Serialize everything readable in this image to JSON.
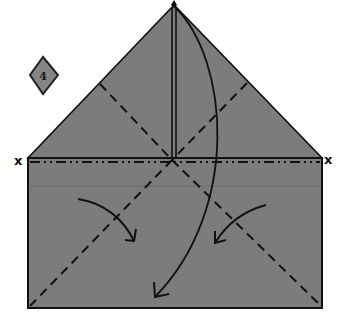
{
  "diagram": {
    "type": "origami-fold-step",
    "step_number": "4",
    "colors": {
      "paper": "#7c7c7c",
      "line": "#111111",
      "background": "#ffffff",
      "badge": "#858585"
    },
    "markers": {
      "left_x": "x",
      "right_x": "x"
    },
    "shapes": {
      "triangle_flap": {
        "apex": [
          174,
          5
        ],
        "left": [
          28,
          158
        ],
        "right": [
          322,
          158
        ]
      },
      "rectangle": {
        "x": 28,
        "y": 158,
        "width": 294,
        "height": 150
      }
    },
    "fold_lines": [
      {
        "kind": "valley",
        "from": [
          100,
          84
        ],
        "to": [
          172,
          160
        ]
      },
      {
        "kind": "valley",
        "from": [
          247,
          83
        ],
        "to": [
          172,
          160
        ]
      },
      {
        "kind": "valley",
        "from": [
          172,
          160
        ],
        "to": [
          30,
          306
        ]
      },
      {
        "kind": "valley",
        "from": [
          172,
          160
        ],
        "to": [
          319,
          304
        ]
      },
      {
        "kind": "mountain",
        "from": [
          30,
          162
        ],
        "to": [
          320,
          162
        ]
      }
    ],
    "arrows": [
      {
        "name": "large-fold-down-arrow",
        "from": [
          174,
          6
        ],
        "to": [
          155,
          297
        ]
      },
      {
        "name": "left-fold-in-arrow",
        "from": [
          78,
          199
        ],
        "to": [
          134,
          241
        ]
      },
      {
        "name": "right-fold-in-arrow",
        "from": [
          266,
          205
        ],
        "to": [
          215,
          243
        ]
      }
    ]
  }
}
